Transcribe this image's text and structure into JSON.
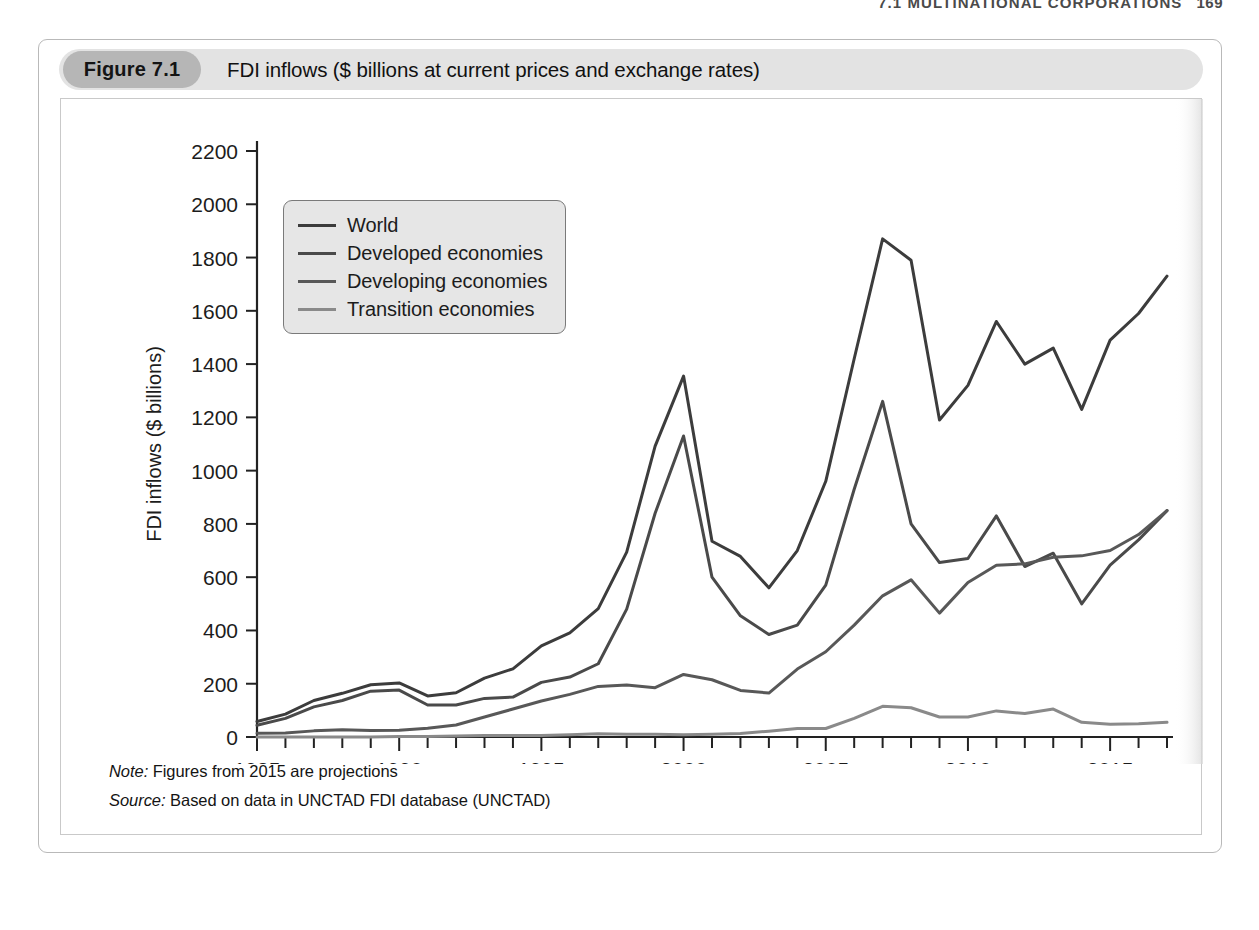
{
  "page_header": {
    "section": "7.1  MULTINATIONAL CORPORATIONS",
    "page_number": "169"
  },
  "figure": {
    "number_label": "Figure 7.1",
    "caption": "FDI inflows ($ billions at current prices and exchange rates)",
    "note": {
      "lead": "Note:",
      "text": " Figures from 2015 are projections"
    },
    "source": {
      "lead": "Source:",
      "text": " Based on data in UNCTAD FDI database (UNCTAD)"
    }
  },
  "legend": {
    "items": [
      {
        "label": "World",
        "color": "#3c3c3c"
      },
      {
        "label": "Developed economies",
        "color": "#4a4a4a"
      },
      {
        "label": "Developing economies",
        "color": "#585858"
      },
      {
        "label": "Transition economies",
        "color": "#8a8a8a"
      }
    ]
  },
  "chart_data": {
    "type": "line",
    "title": "FDI inflows ($ billions at current prices and exchange rates)",
    "xlabel": "",
    "ylabel": "FDI inflows ($ billions)",
    "xlim": [
      1985,
      2017
    ],
    "ylim": [
      0,
      2200
    ],
    "ytick_step": 200,
    "yticks": [
      0,
      200,
      400,
      600,
      800,
      1000,
      1200,
      1400,
      1600,
      1800,
      2000,
      2200
    ],
    "xticks_labeled": [
      1985,
      1990,
      1995,
      2000,
      2005,
      2010,
      2015
    ],
    "xtick_minor_step": 1,
    "grid": false,
    "legend_position": "upper-left-inside",
    "x": [
      1985,
      1986,
      1987,
      1988,
      1989,
      1990,
      1991,
      1992,
      1993,
      1994,
      1995,
      1996,
      1997,
      1998,
      1999,
      2000,
      2001,
      2002,
      2003,
      2004,
      2005,
      2006,
      2007,
      2008,
      2009,
      2010,
      2011,
      2012,
      2013,
      2014,
      2015,
      2016,
      2017
    ],
    "series": [
      {
        "name": "World",
        "color": "#3c3c3c",
        "width": 3.0,
        "values": [
          58,
          86,
          137,
          164,
          196,
          203,
          154,
          166,
          221,
          256,
          342,
          391,
          482,
          694,
          1092,
          1355,
          735,
          678,
          560,
          700,
          960,
          1420,
          1870,
          1790,
          1190,
          1320,
          1560,
          1400,
          1460,
          1230,
          1490,
          1590,
          1730
        ]
      },
      {
        "name": "Developed economies",
        "color": "#4a4a4a",
        "width": 3.0,
        "values": [
          44,
          70,
          113,
          137,
          172,
          176,
          120,
          120,
          145,
          150,
          205,
          225,
          275,
          480,
          840,
          1130,
          600,
          455,
          385,
          420,
          570,
          930,
          1260,
          800,
          655,
          670,
          830,
          640,
          690,
          500,
          645,
          740,
          850
        ]
      },
      {
        "name": "Developing economies",
        "color": "#585858",
        "width": 3.0,
        "values": [
          14,
          15,
          23,
          27,
          24,
          25,
          33,
          45,
          75,
          105,
          135,
          160,
          190,
          195,
          185,
          235,
          215,
          175,
          165,
          255,
          320,
          420,
          530,
          590,
          465,
          580,
          645,
          650,
          675,
          680,
          700,
          760,
          850
        ]
      },
      {
        "name": "Transition economies",
        "color": "#8a8a8a",
        "width": 3.0,
        "values": [
          0,
          0,
          0,
          0,
          0,
          2,
          2,
          4,
          6,
          6,
          6,
          8,
          12,
          10,
          10,
          8,
          10,
          13,
          22,
          32,
          32,
          70,
          115,
          110,
          75,
          75,
          98,
          88,
          105,
          55,
          48,
          50,
          55
        ]
      }
    ]
  }
}
